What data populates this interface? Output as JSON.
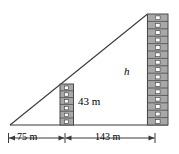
{
  "figure": {
    "type": "geometry-diagram",
    "colors": {
      "line": "#3a3a3a",
      "building_fill": "#a8a8a8",
      "building_edge": "#4a4a4a",
      "window_fill": "#ffffff",
      "background": "#ffffff"
    },
    "labels": {
      "short_building_height": "43 m",
      "tall_building_height": "h",
      "near_distance": "75 m",
      "far_distance": "143 m"
    },
    "geometry": {
      "apex": [
        147,
        14
      ],
      "left_vertex": [
        10,
        125
      ],
      "base_right": [
        168,
        125
      ],
      "ground_y": 125,
      "short_building": {
        "x": 60,
        "y": 84,
        "width": 13,
        "height": 41,
        "floors": 6
      },
      "tall_building": {
        "x": 147,
        "y": 14,
        "width": 21,
        "height": 111,
        "floors": 15
      },
      "dimension_line_y": 138,
      "dimension_ticks": [
        8,
        65,
        155
      ]
    },
    "measurements": [
      {
        "name": "near_distance",
        "value": 75,
        "unit": "m"
      },
      {
        "name": "far_distance",
        "value": 143,
        "unit": "m"
      },
      {
        "name": "short_building_height",
        "value": 43,
        "unit": "m"
      },
      {
        "name": "tall_building_height",
        "value": "h",
        "unit": "m"
      }
    ]
  }
}
